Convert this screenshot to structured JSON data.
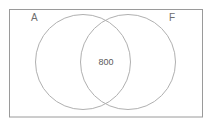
{
  "figure": {
    "type": "venn-diagram",
    "sets": [
      {
        "id": "A",
        "label": "A",
        "label_x": 31,
        "label_y": 21,
        "cx": 83,
        "cy": 62,
        "r": 47.5
      },
      {
        "id": "F",
        "label": "F",
        "label_x": 169,
        "label_y": 21,
        "cx": 128,
        "cy": 62,
        "r": 47.5
      }
    ],
    "regions": [
      {
        "id": "intersection",
        "label": "800",
        "x": 106,
        "y": 65
      }
    ],
    "universe": {
      "x": 9.5,
      "y": 9.5,
      "width": 193,
      "height": 107.5
    },
    "colors": {
      "background": "#ffffff",
      "universe_border": "#9a9a9a",
      "circle_stroke": "#b0b0b0",
      "label_text": "#6e6e6e",
      "value_text": "#5a5a5a"
    },
    "stroke_widths": {
      "universe_border": 1,
      "circle": 1
    }
  },
  "chart_data": {
    "type": "venn",
    "title": "",
    "set_labels": [
      "A",
      "F"
    ],
    "regions": [
      {
        "sets": [
          "A",
          "F"
        ],
        "label": "800",
        "value": 800
      },
      {
        "sets": [
          "A"
        ],
        "label": "",
        "value": null
      },
      {
        "sets": [
          "F"
        ],
        "label": "",
        "value": null
      }
    ],
    "universe_label": ""
  }
}
